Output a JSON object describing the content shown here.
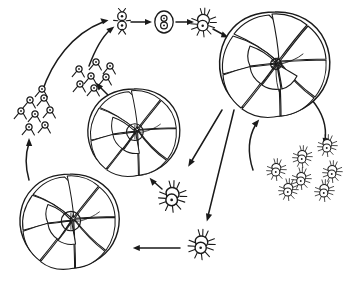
{
  "figure": {
    "background_color": "#ffffff",
    "ink_color": "#1a1a1a",
    "width": 351,
    "height": 281,
    "style": "black ink line drawing, stippled shading, no caption text"
  },
  "labels": {
    "zygote_mark": "8"
  },
  "stages": [
    {
      "id": "gamete-cluster-left",
      "name": "left gamete swarm",
      "description": "cluster of small biflagellate gametes released from the megalospheric test",
      "count": 8,
      "x": 42,
      "y": 110
    },
    {
      "id": "gamete-cluster-mid",
      "name": "middle gamete swarm",
      "description": "second cluster of small flagellated gametes",
      "count": 7,
      "x": 96,
      "y": 76
    },
    {
      "id": "paired-gametes",
      "name": "paired gametes fusing",
      "description": "two gametes aligned vertically, beginning syngamy",
      "count": 2,
      "x": 122,
      "y": 22
    },
    {
      "id": "zygote",
      "name": "zygote",
      "description": "oval zygote enclosing two fused gamete nuclei drawn as a figure-eight",
      "count": 1,
      "x": 164,
      "y": 19
    },
    {
      "id": "young-agamont",
      "name": "young amoeboid agamont",
      "description": "zygote developing into a flagellate-amoeboid cell with pseudopodia",
      "count": 1,
      "x": 203,
      "y": 22
    },
    {
      "id": "test-agamont",
      "name": "microspheric agamont test",
      "description": "large spiral multi-chambered foraminiferan test, stippled chambers",
      "chambers": 12,
      "x": 275,
      "y": 65
    },
    {
      "id": "agamete-cluster",
      "name": "agamete swarm",
      "description": "cluster of amoeboid agametes released by multiple fission of the agamont",
      "count": 7,
      "x": 300,
      "y": 168
    },
    {
      "id": "agamete-mid",
      "name": "single amoeboid agamete",
      "description": "amoeboid cell with radiating pseudopodia migrating to form a new test",
      "count": 1,
      "x": 170,
      "y": 196
    },
    {
      "id": "agamete-lower",
      "name": "single amoeboid agamete (lower)",
      "description": "second released amoeboid agamete with radiating pseudopodia",
      "count": 1,
      "x": 200,
      "y": 244
    },
    {
      "id": "test-gamont-mid",
      "name": "megalospheric gamont test (middle)",
      "description": "spiral multi-chambered foraminiferan test producing gametes",
      "chambers": 11,
      "x": 134,
      "y": 133
    },
    {
      "id": "test-gamont-lower",
      "name": "megalospheric gamont test (lower left)",
      "description": "spiral multi-chambered foraminiferan test producing gametes",
      "chambers": 11,
      "x": 70,
      "y": 222
    }
  ],
  "arrows": [
    {
      "id": "a1",
      "name": "left-gametes-to-pairing",
      "from": "gamete-cluster-left",
      "to": "paired-gametes",
      "shape": "curved"
    },
    {
      "id": "a2",
      "name": "mid-gametes-to-pairing",
      "from": "gamete-cluster-mid",
      "to": "paired-gametes",
      "shape": "curved"
    },
    {
      "id": "a3",
      "name": "pairing-to-zygote",
      "from": "paired-gametes",
      "to": "zygote",
      "shape": "straight"
    },
    {
      "id": "a4",
      "name": "zygote-to-young-agamont",
      "from": "zygote",
      "to": "young-agamont",
      "shape": "straight"
    },
    {
      "id": "a5",
      "name": "young-agamont-to-agamont-test",
      "from": "young-agamont",
      "to": "test-agamont",
      "shape": "straight"
    },
    {
      "id": "a6",
      "name": "agamont-test-to-agametes",
      "from": "test-agamont",
      "to": "agamete-cluster",
      "shape": "curved"
    },
    {
      "id": "a7",
      "name": "agametes-back-to-agamont-test",
      "from": "agamete-cluster",
      "to": "test-agamont",
      "shape": "curved"
    },
    {
      "id": "a8",
      "name": "agamont-test-to-mid-agamete",
      "from": "test-agamont",
      "to": "agamete-mid",
      "shape": "straight"
    },
    {
      "id": "a9",
      "name": "agamont-test-to-lower-agamete",
      "from": "test-agamont",
      "to": "agamete-lower",
      "shape": "straight"
    },
    {
      "id": "a10",
      "name": "mid-agamete-to-mid-gamont-test",
      "from": "agamete-mid",
      "to": "test-gamont-mid",
      "shape": "straight"
    },
    {
      "id": "a11",
      "name": "lower-agamete-to-lower-gamont-test",
      "from": "agamete-lower",
      "to": "test-gamont-lower",
      "shape": "straight"
    },
    {
      "id": "a12",
      "name": "mid-gamont-test-to-mid-gametes",
      "from": "test-gamont-mid",
      "to": "gamete-cluster-mid",
      "shape": "straight"
    },
    {
      "id": "a13",
      "name": "lower-gamont-test-to-left-gametes",
      "from": "test-gamont-lower",
      "to": "gamete-cluster-left",
      "shape": "curved"
    }
  ]
}
